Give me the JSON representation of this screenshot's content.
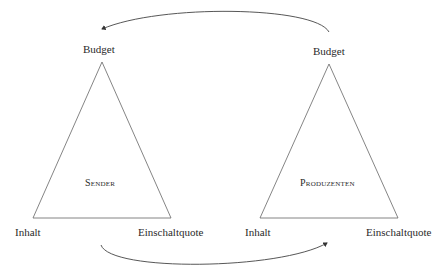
{
  "diagram": {
    "left_triangle": {
      "center_label": "Sender",
      "apex_label": "Budget",
      "base_left_label": "Inhalt",
      "base_right_label": "Einschaltquote"
    },
    "right_triangle": {
      "center_label": "Produzenten",
      "apex_label": "Budget",
      "base_left_label": "Inhalt",
      "base_right_label": "Einschaltquote"
    },
    "arrows": [
      {
        "from": "right_triangle.apex",
        "to": "left_triangle.apex",
        "position": "top"
      },
      {
        "from": "left_triangle.base",
        "to": "right_triangle.base",
        "position": "bottom"
      }
    ],
    "colors": {
      "line": "#555555",
      "text": "#2a2a2a",
      "background": "#ffffff"
    }
  }
}
